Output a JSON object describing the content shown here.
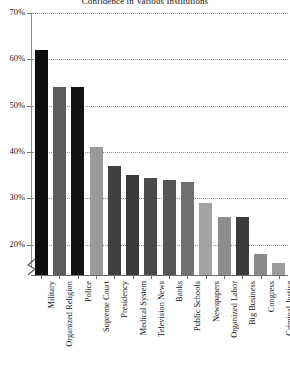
{
  "chart_data": {
    "type": "bar",
    "title": "Confidence in Various Institutions",
    "xlabel": "",
    "ylabel": "",
    "ylim": [
      15,
      70
    ],
    "grid": true,
    "legend": null,
    "y_ticks": [
      "20%",
      "30%",
      "40%",
      "50%",
      "60%",
      "70%"
    ],
    "y_tick_values": [
      20,
      30,
      40,
      50,
      60,
      70
    ],
    "axis_break": true,
    "categories": [
      "Military",
      "Organized Religion",
      "Police",
      "Supreme Court",
      "Presidency",
      "Medical System",
      "Television News",
      "Banks",
      "Public Schools",
      "Newspapers",
      "Organized Labor",
      "Big Business",
      "Congress",
      "Criminal Justice"
    ],
    "values": [
      62,
      54,
      54,
      41,
      37,
      35,
      34.5,
      34,
      33.5,
      29,
      26,
      26,
      18,
      16
    ],
    "bar_colors": [
      "#0d0d0d",
      "#5c5c5c",
      "#131313",
      "#9a9a9a",
      "#404040",
      "#3a3a3a",
      "#4a4a4a",
      "#565656",
      "#707070",
      "#a3a3a3",
      "#8d8d8d",
      "#3b3b3b",
      "#8a8a8a",
      "#9c9c9c"
    ]
  },
  "axis": {
    "line_color": "#8c8c8c",
    "grid_color": "#8f8f8f"
  }
}
